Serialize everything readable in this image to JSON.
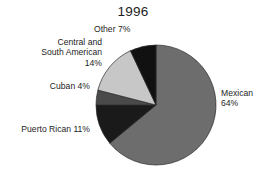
{
  "chart_data": {
    "type": "pie",
    "title": "1996",
    "xlabel": "",
    "ylabel": "",
    "legend_position": "none",
    "grid": false,
    "categories": [
      "Mexican",
      "Other",
      "Central and South American",
      "Cuban",
      "Puerto Rican"
    ],
    "values": [
      64,
      14,
      11,
      7,
      4
    ],
    "slices": [
      {
        "name": "Mexican",
        "value": 64,
        "label": "Mexican\n64%",
        "label_lines": [
          "Mexican",
          "64%"
        ],
        "color": "#6d6d6d"
      },
      {
        "name": "Other",
        "value": 7,
        "label": "Other 7%",
        "label_lines": [
          "Other 7%"
        ],
        "color": "#111111"
      },
      {
        "name": "Central and South American",
        "value": 14,
        "label": "Central and\nSouth American\n14%",
        "label_lines": [
          "Central and",
          "South American",
          "14%"
        ],
        "color": "#c7c7c7"
      },
      {
        "name": "Cuban",
        "value": 4,
        "label": "Cuban 4%",
        "label_lines": [
          "Cuban 4%"
        ],
        "color": "#4a4a4a"
      },
      {
        "name": "Puerto Rican",
        "value": 11,
        "label": "Puerto Rican 11%",
        "label_lines": [
          "Puerto Rican 11%"
        ],
        "color": "#1a1a1a"
      }
    ],
    "total": 100,
    "units": "percent",
    "start_angle_deg": 90,
    "direction": "mexican-clockwise-others-counterclockwise"
  },
  "labels": {
    "title": "1996",
    "mexican": "Mexican\n64%",
    "other": "Other 7%",
    "central": "Central and\nSouth American\n14%",
    "cuban": "Cuban 4%",
    "puerto_rican": "Puerto Rican 11%"
  },
  "colors": {
    "background": "#ffffff",
    "text": "#1d1d1d",
    "mexican": "#6d6d6d",
    "other": "#111111",
    "central": "#c7c7c7",
    "cuban": "#4a4a4a",
    "puerto_rican": "#1a1a1a",
    "outline": "#2a2a2a"
  }
}
